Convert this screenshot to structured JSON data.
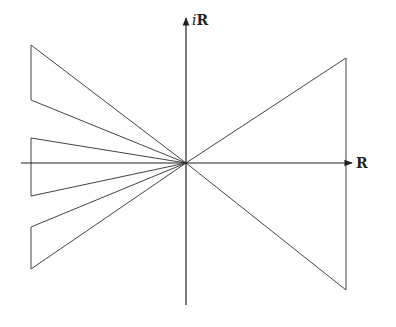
{
  "diagram": {
    "title": "",
    "origin": [
      186,
      163
    ],
    "axes": {
      "horizontal": {
        "x1": 21,
        "x2": 352,
        "y": 163,
        "label": "R"
      },
      "vertical": {
        "x": 186,
        "y1": 305,
        "y2": 18,
        "label_prefix": "i",
        "label": "R"
      }
    },
    "wedges": [
      {
        "name": "left-upper-wedge",
        "points": [
          [
            31,
            45
          ],
          [
            31,
            100
          ],
          [
            186,
            163
          ]
        ]
      },
      {
        "name": "left-middle-wedge",
        "points": [
          [
            31,
            138
          ],
          [
            31,
            196
          ],
          [
            186,
            163
          ]
        ]
      },
      {
        "name": "left-lower-wedge",
        "points": [
          [
            31,
            227
          ],
          [
            31,
            269
          ],
          [
            186,
            163
          ]
        ]
      },
      {
        "name": "right-wedge",
        "points": [
          [
            346,
            58
          ],
          [
            346,
            290
          ],
          [
            186,
            163
          ]
        ]
      }
    ],
    "stroke_color": "#444444"
  }
}
